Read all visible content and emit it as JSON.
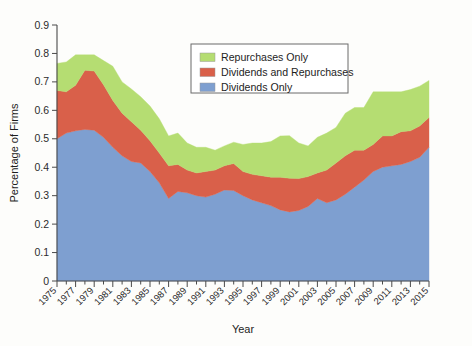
{
  "chart_data": {
    "type": "area",
    "stacked": true,
    "title": "",
    "xlabel": "Year",
    "ylabel": "Percentage of Firms",
    "xlim": [
      1975,
      2015
    ],
    "ylim": [
      0,
      0.9
    ],
    "ytick_labels": [
      "0",
      "0.1",
      "0.2",
      "0.3",
      "0.4",
      "0.5",
      "0.6",
      "0.7",
      "0.8",
      "0.9"
    ],
    "ytick_values": [
      0,
      0.1,
      0.2,
      0.3,
      0.4,
      0.5,
      0.6,
      0.7,
      0.8,
      0.9
    ],
    "xtick_labels": [
      "1975",
      "1977",
      "1979",
      "1981",
      "1983",
      "1985",
      "1987",
      "1989",
      "1991",
      "1993",
      "1995",
      "1997",
      "1999",
      "2001",
      "2003",
      "2005",
      "2007",
      "2009",
      "2011",
      "2013",
      "2015"
    ],
    "grid": false,
    "legend_position": "top-center",
    "x": [
      1975,
      1976,
      1977,
      1978,
      1979,
      1980,
      1981,
      1982,
      1983,
      1984,
      1985,
      1986,
      1987,
      1988,
      1989,
      1990,
      1991,
      1992,
      1993,
      1994,
      1995,
      1996,
      1997,
      1998,
      1999,
      2000,
      2001,
      2002,
      2003,
      2004,
      2005,
      2006,
      2007,
      2008,
      2009,
      2010,
      2011,
      2012,
      2013,
      2014,
      2015
    ],
    "series": [
      {
        "name": "Dividends Only",
        "color": "#7e9fd0",
        "values": [
          0.5,
          0.52,
          0.528,
          0.533,
          0.53,
          0.505,
          0.47,
          0.44,
          0.42,
          0.415,
          0.385,
          0.345,
          0.29,
          0.315,
          0.31,
          0.3,
          0.295,
          0.305,
          0.32,
          0.318,
          0.3,
          0.285,
          0.275,
          0.265,
          0.25,
          0.243,
          0.248,
          0.262,
          0.29,
          0.275,
          0.285,
          0.305,
          0.33,
          0.355,
          0.385,
          0.4,
          0.405,
          0.41,
          0.42,
          0.435,
          0.47
        ]
      },
      {
        "name": "Dividends and Repurchases",
        "color": "#d9604a",
        "values": [
          0.17,
          0.145,
          0.16,
          0.208,
          0.208,
          0.185,
          0.165,
          0.15,
          0.14,
          0.115,
          0.108,
          0.105,
          0.115,
          0.095,
          0.08,
          0.08,
          0.09,
          0.085,
          0.085,
          0.095,
          0.085,
          0.09,
          0.095,
          0.1,
          0.115,
          0.118,
          0.112,
          0.105,
          0.09,
          0.115,
          0.13,
          0.135,
          0.13,
          0.105,
          0.095,
          0.11,
          0.105,
          0.115,
          0.108,
          0.11,
          0.105
        ]
      },
      {
        "name": "Repurchases Only",
        "color": "#b5dd72",
        "values": [
          0.095,
          0.105,
          0.107,
          0.054,
          0.057,
          0.085,
          0.12,
          0.11,
          0.115,
          0.118,
          0.122,
          0.12,
          0.105,
          0.11,
          0.095,
          0.09,
          0.085,
          0.07,
          0.07,
          0.075,
          0.095,
          0.11,
          0.115,
          0.125,
          0.145,
          0.15,
          0.125,
          0.108,
          0.125,
          0.13,
          0.125,
          0.15,
          0.15,
          0.15,
          0.185,
          0.155,
          0.155,
          0.14,
          0.145,
          0.14,
          0.13
        ]
      }
    ],
    "legend": [
      {
        "label": "Repurchases Only",
        "color": "#b5dd72"
      },
      {
        "label": "Dividends and Repurchases",
        "color": "#d9604a"
      },
      {
        "label": "Dividends Only",
        "color": "#7e9fd0"
      }
    ]
  }
}
